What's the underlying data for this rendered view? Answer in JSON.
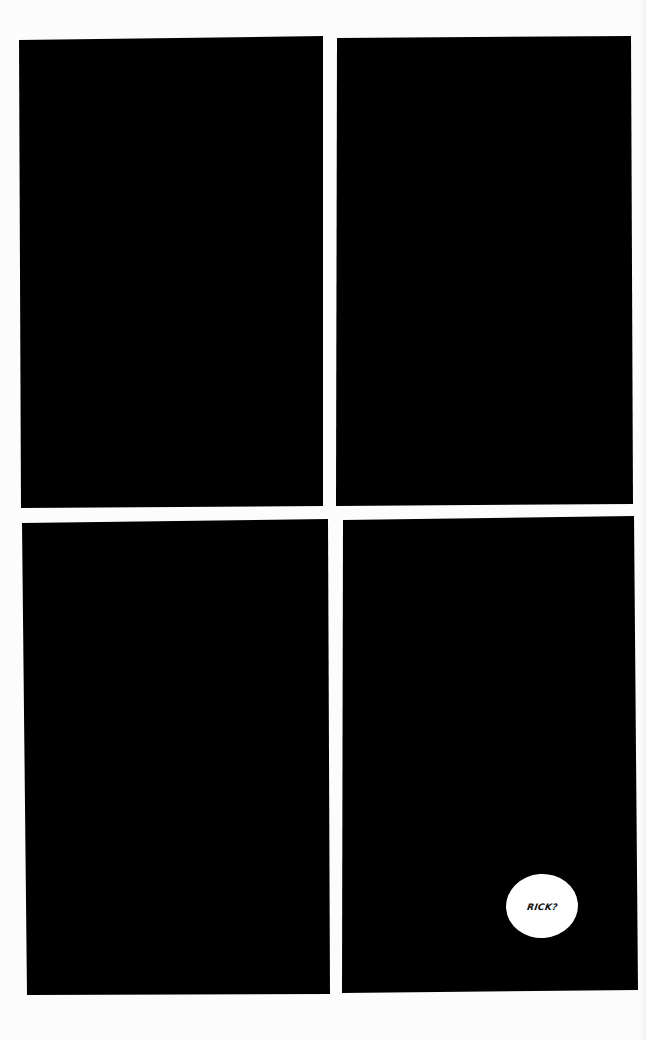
{
  "page": {
    "type": "comic-page",
    "layout": "2x2 grid",
    "background_color": "#fcfcfc",
    "panel_color": "#000000"
  },
  "panels": [
    {
      "id": 1,
      "position": "top-left",
      "content": "solid black"
    },
    {
      "id": 2,
      "position": "top-right",
      "content": "solid black"
    },
    {
      "id": 3,
      "position": "bottom-left",
      "content": "solid black"
    },
    {
      "id": 4,
      "position": "bottom-right",
      "content": "solid black",
      "speech_bubble": {
        "text": "RICK?",
        "shape": "ellipse",
        "fill": "#ffffff",
        "text_color": "#111111"
      }
    }
  ]
}
